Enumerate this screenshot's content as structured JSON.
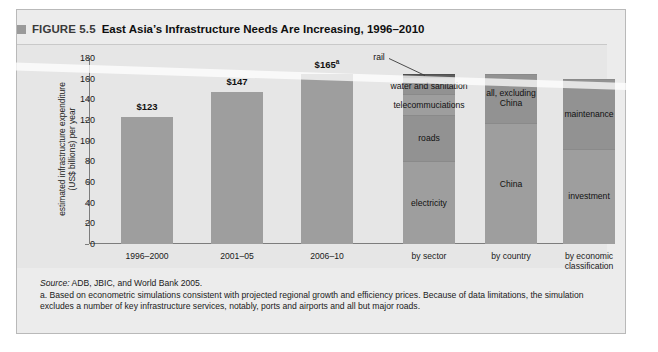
{
  "figure": {
    "marker_icon": "square-marker-icon",
    "number": "FIGURE 5.5",
    "title": "East Asia’s Infrastructure Needs Are Increasing, 1996–2010"
  },
  "notes": {
    "source_label": "Source:",
    "source_text": " ADB, JBIC, and World Bank 2005.",
    "note_a": "a. Based on econometric simulations consistent with projected regional growth and efficiency prices. Because of data limitations, the simulation excludes a number of key infrastructure services, notably, ports and airports and all but major roads."
  },
  "colors": {
    "panel_background": "#e6e6e6",
    "frame_background": "#ececec",
    "bar_fill": "#9e9e9e",
    "bar_fill_mid": "#929292",
    "bar_fill_dark": "#5d5d5d",
    "axis": "#7d7d7d",
    "text": "#1a1a1a"
  },
  "chart_data": {
    "type": "bar",
    "title": "East Asia’s Infrastructure Needs Are Increasing, 1996–2010",
    "xlabel": "",
    "ylabel": "estimated infrastructure expenditure\n(US$ billions) per year",
    "ylim": [
      0,
      180
    ],
    "yticks": [
      0,
      20,
      40,
      60,
      80,
      100,
      120,
      140,
      160,
      180
    ],
    "ytick_labels": [
      "0",
      "20",
      "40",
      "60",
      "80",
      "100",
      "120",
      "140",
      "160",
      "180"
    ],
    "grid": false,
    "legend": "none",
    "categories": [
      "1996–2000",
      "2001–05",
      "2006–10"
    ],
    "values": [
      123,
      147,
      165
    ],
    "value_labels": [
      "$123",
      "$147",
      "$165"
    ],
    "value_label_superscripts": [
      "",
      "",
      "a"
    ],
    "stacked_breakdowns": [
      {
        "name": "by sector",
        "total": 165,
        "segments": [
          {
            "label": "rail",
            "value": 4,
            "callout": true
          },
          {
            "label": "water and sanitation",
            "value": 16,
            "callout": false
          },
          {
            "label": "telecommuciations",
            "value": 20,
            "callout": false
          },
          {
            "label": "roads",
            "value": 45,
            "callout": false
          },
          {
            "label": "electricity",
            "value": 80,
            "callout": false
          }
        ]
      },
      {
        "name": "by country",
        "total": 165,
        "segments": [
          {
            "label": "all, excluding\nChina",
            "value": 48,
            "callout": false
          },
          {
            "label": "China",
            "value": 117,
            "callout": false
          }
        ]
      },
      {
        "name": "by economic\nclassification",
        "total": 160,
        "segments": [
          {
            "label": "maintenance",
            "value": 68,
            "callout": false
          },
          {
            "label": "investment",
            "value": 92,
            "callout": false
          }
        ]
      }
    ],
    "group_labels": [
      "1996–2000",
      "2001–05",
      "2006–10",
      "by sector",
      "by country",
      "by economic\nclassification"
    ]
  }
}
